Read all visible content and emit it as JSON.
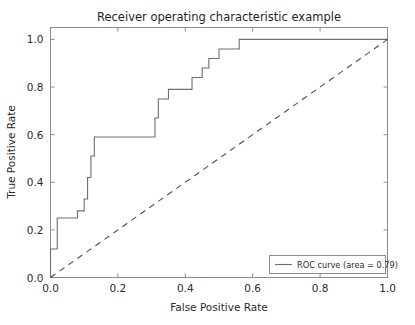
{
  "chart_data": {
    "type": "line",
    "title": "Receiver operating characteristic example",
    "xlabel": "False Positive Rate",
    "ylabel": "True Positive Rate",
    "xlim": [
      0.0,
      1.0
    ],
    "ylim": [
      0.0,
      1.05
    ],
    "grid": false,
    "legend_position": "lower right",
    "xticks": [
      "0.0",
      "0.2",
      "0.4",
      "0.6",
      "0.8",
      "1.0"
    ],
    "xtick_values": [
      0.0,
      0.2,
      0.4,
      0.6,
      0.8,
      1.0
    ],
    "yticks": [
      "0.0",
      "0.2",
      "0.4",
      "0.6",
      "0.8",
      "1.0"
    ],
    "ytick_values": [
      0.0,
      0.2,
      0.4,
      0.6,
      0.8,
      1.0
    ],
    "series": [
      {
        "name": "ROC curve (area = 0.79)",
        "style": "solid",
        "color": "#6e6e6e",
        "drawstyle": "steps-post",
        "x": [
          0.0,
          0.0,
          0.02,
          0.02,
          0.08,
          0.08,
          0.1,
          0.1,
          0.11,
          0.11,
          0.12,
          0.12,
          0.13,
          0.13,
          0.17,
          0.17,
          0.31,
          0.31,
          0.32,
          0.32,
          0.35,
          0.35,
          0.42,
          0.42,
          0.45,
          0.45,
          0.47,
          0.47,
          0.5,
          0.5,
          0.56,
          0.56,
          1.0
        ],
        "y": [
          0.0,
          0.12,
          0.12,
          0.25,
          0.25,
          0.28,
          0.28,
          0.33,
          0.33,
          0.42,
          0.42,
          0.51,
          0.51,
          0.59,
          0.59,
          0.59,
          0.59,
          0.67,
          0.67,
          0.75,
          0.75,
          0.79,
          0.79,
          0.84,
          0.84,
          0.88,
          0.88,
          0.92,
          0.92,
          0.96,
          0.96,
          1.0,
          1.0
        ]
      },
      {
        "name": "chance-diagonal",
        "style": "dashed",
        "color": "#4d4d4d",
        "drawstyle": "default",
        "x": [
          0.0,
          1.0
        ],
        "y": [
          0.0,
          1.0
        ]
      }
    ],
    "legend_entries": [
      {
        "label": "ROC curve (area = 0.79)",
        "color": "#6e6e6e",
        "style": "solid"
      }
    ],
    "auc": 0.79
  },
  "figure": {
    "background": "#ffffff",
    "axes_color": "#8c8c8c",
    "text_color": "#2b2b2b"
  }
}
